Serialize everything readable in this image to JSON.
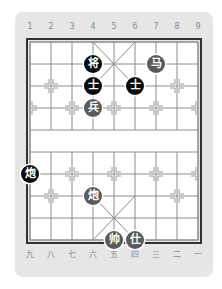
{
  "board": {
    "top_labels": [
      "1",
      "2",
      "3",
      "4",
      "5",
      "6",
      "7",
      "8",
      "9"
    ],
    "bottom_labels": [
      "九",
      "八",
      "七",
      "六",
      "五",
      "四",
      "三",
      "二",
      "一"
    ],
    "colors": {
      "card_bg": "#e6e6e6",
      "board_bg": "#ffffff",
      "grid_line": "#8c8c8c",
      "border": "#333333",
      "black_piece": "#0c0c0c",
      "red_piece": "#5a5a5a",
      "label": "#8a8a8a"
    }
  },
  "pieces": [
    {
      "char": "将",
      "side": "black",
      "col": 4,
      "row": 1,
      "name": "black-general"
    },
    {
      "char": "马",
      "side": "red",
      "col": 7,
      "row": 1,
      "name": "red-horse"
    },
    {
      "char": "士",
      "side": "black",
      "col": 4,
      "row": 2,
      "name": "black-advisor-left"
    },
    {
      "char": "士",
      "side": "black",
      "col": 6,
      "row": 2,
      "name": "black-advisor-right"
    },
    {
      "char": "兵",
      "side": "red",
      "col": 4,
      "row": 3,
      "name": "red-soldier"
    },
    {
      "char": "炮",
      "side": "black",
      "col": 1,
      "row": 6,
      "name": "black-cannon"
    },
    {
      "char": "炮",
      "side": "red",
      "col": 4,
      "row": 7,
      "name": "red-cannon"
    },
    {
      "char": "帅",
      "side": "red",
      "col": 5,
      "row": 9,
      "name": "red-general"
    },
    {
      "char": "仕",
      "side": "red",
      "col": 6,
      "row": 9,
      "name": "red-advisor"
    }
  ]
}
